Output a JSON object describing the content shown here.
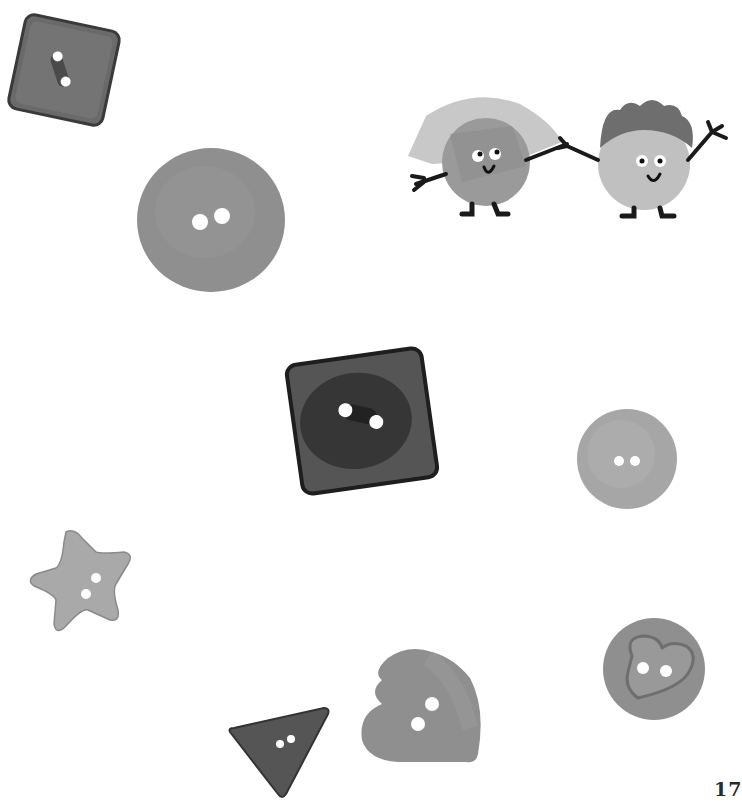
{
  "page": {
    "number": "17",
    "background": "#ffffff",
    "style": "grayscale picture-book illustration"
  },
  "illustration": {
    "characters": [
      {
        "name": "girl-button-character",
        "hair": "light gray bob",
        "body": "round button",
        "face": "smiling, eyes looking up"
      },
      {
        "name": "boy-button-character",
        "hair": "dark gray curly",
        "body": "round button",
        "face": "smiling, waving hand"
      }
    ],
    "buttons": [
      {
        "shape": "square",
        "tone": "dark gray",
        "holes": 2,
        "position": "top-left"
      },
      {
        "shape": "round",
        "tone": "medium gray",
        "holes": 2,
        "position": "upper-left"
      },
      {
        "shape": "square",
        "tone": "very dark gray",
        "holes": 2,
        "position": "center"
      },
      {
        "shape": "round",
        "tone": "light gray",
        "holes": 2,
        "position": "middle-right"
      },
      {
        "shape": "star",
        "tone": "light gray",
        "holes": 2,
        "position": "lower-left"
      },
      {
        "shape": "triangle",
        "tone": "dark gray",
        "holes": 2,
        "position": "bottom"
      },
      {
        "shape": "heart",
        "tone": "medium gray",
        "holes": 2,
        "position": "bottom-center"
      },
      {
        "shape": "round with heart",
        "tone": "medium gray",
        "holes": 2,
        "position": "bottom-right"
      }
    ],
    "button_count": "8"
  },
  "colors": {
    "dark": "#5c5c5c",
    "very_dark": "#3e3e3e",
    "medium": "#8e8e8e",
    "light": "#a9a9a9",
    "outline": "#222222"
  }
}
